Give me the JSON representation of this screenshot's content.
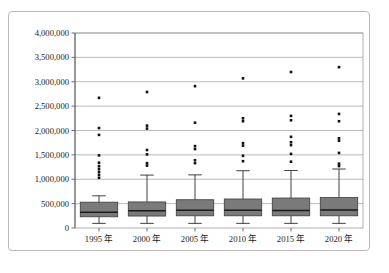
{
  "chart_data": {
    "type": "box",
    "title": "",
    "subtitle": "",
    "xlabel": "",
    "ylabel": "",
    "ylim": [
      0,
      4000000
    ],
    "grid": true,
    "legend": "none",
    "categories": [
      "1995 年",
      "2000 年",
      "2005 年",
      "2010 年",
      "2015 年",
      "2020 年"
    ],
    "y_ticks": [
      0,
      500000,
      1000000,
      1500000,
      2000000,
      2500000,
      3000000,
      3500000,
      4000000
    ],
    "y_tick_labels": [
      "0",
      "500,000",
      "1,000,000",
      "1,500,000",
      "2,000,000",
      "2,500,000",
      "3,000,000",
      "3,500,000",
      "4,000,000"
    ],
    "boxes": [
      {
        "category": "1995 年",
        "whisker_low": 95000,
        "q1": 230000,
        "median": 325000,
        "q3": 530000,
        "whisker_high": 660000,
        "outliers": [
          1030000,
          1090000,
          1150000,
          1210000,
          1270000,
          1340000,
          1490000,
          1910000,
          2050000,
          2670000
        ]
      },
      {
        "category": "2000 年",
        "whisker_low": 95000,
        "q1": 245000,
        "median": 355000,
        "q3": 535000,
        "whisker_high": 1085000,
        "outliers": [
          1280000,
          1330000,
          1510000,
          1600000,
          2040000,
          2100000,
          2790000
        ]
      },
      {
        "category": "2005 年",
        "whisker_low": 95000,
        "q1": 250000,
        "median": 365000,
        "q3": 580000,
        "whisker_high": 1090000,
        "outliers": [
          1330000,
          1390000,
          1620000,
          1680000,
          2160000,
          2910000
        ]
      },
      {
        "category": "2010 年",
        "whisker_low": 95000,
        "q1": 250000,
        "median": 365000,
        "q3": 595000,
        "whisker_high": 1175000,
        "outliers": [
          1370000,
          1480000,
          1690000,
          1740000,
          2190000,
          2250000,
          3070000
        ]
      },
      {
        "category": "2015 年",
        "whisker_low": 95000,
        "q1": 250000,
        "median": 360000,
        "q3": 615000,
        "whisker_high": 1180000,
        "outliers": [
          1360000,
          1520000,
          1700000,
          1760000,
          1870000,
          2210000,
          2300000,
          3200000
        ]
      },
      {
        "category": "2020 年",
        "whisker_low": 95000,
        "q1": 250000,
        "median": 370000,
        "q3": 625000,
        "whisker_high": 1210000,
        "outliers": [
          1270000,
          1320000,
          1540000,
          1790000,
          1840000,
          2190000,
          2340000,
          3300000
        ]
      }
    ],
    "colors": {
      "box_fill": "#7a7a7a",
      "box_edge": "#3d3d3d",
      "median": "#1a1a1a",
      "whisker": "#2b2b2b",
      "outlier": "#111111",
      "gridline": "#8d8d8d",
      "axis": "#4a4a4a",
      "frame_border": "#b9b9b9",
      "background": "#ffffff",
      "text": "#1a1a1a"
    }
  }
}
